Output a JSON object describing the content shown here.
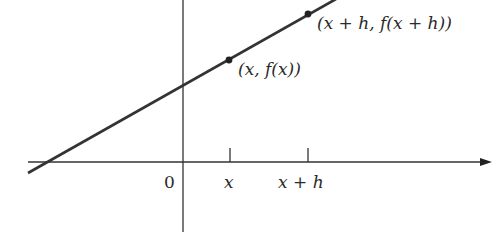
{
  "diagram": {
    "colors": {
      "background": "#ffffff",
      "ink": "#2a2a2a",
      "line": "#333333"
    },
    "axes": {
      "origin_label": "0",
      "x_axis": {
        "has_arrow": true
      },
      "y_axis": {
        "has_arrow": false
      }
    },
    "ticks": [
      {
        "id": "x",
        "label": "x"
      },
      {
        "id": "x_plus_h",
        "label": "x + h"
      }
    ],
    "points": [
      {
        "id": "p1",
        "label": "(x, f(x))"
      },
      {
        "id": "p2",
        "label": "(x + h, f(x + h))"
      }
    ]
  }
}
